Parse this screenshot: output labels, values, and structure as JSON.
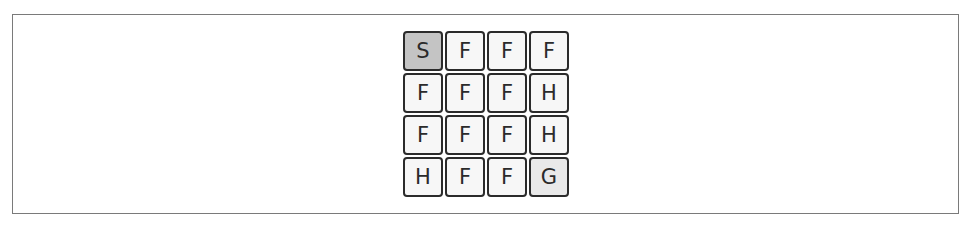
{
  "diagram": {
    "title": "",
    "grid": {
      "rows": 4,
      "cols": 4,
      "cells": [
        [
          "S",
          "F",
          "F",
          "F"
        ],
        [
          "F",
          "F",
          "F",
          "H"
        ],
        [
          "F",
          "F",
          "F",
          "H"
        ],
        [
          "H",
          "F",
          "F",
          "G"
        ]
      ],
      "legend_colors": {
        "S": "#c4c4c4",
        "G": "#e9e9e9",
        "F": "#f7f7f7",
        "H": "#f7f7f7"
      }
    }
  }
}
